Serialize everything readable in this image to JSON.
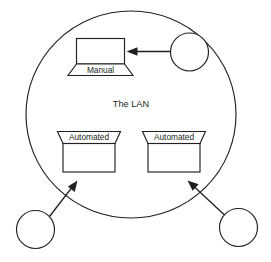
{
  "diagram": {
    "kind": "network-topology-diagram",
    "region": {
      "name": "lan-boundary",
      "label": "The LAN",
      "shape": "ellipse"
    },
    "nodes": [
      {
        "id": "manual-workstation",
        "label": "Manual",
        "shape": "laptop",
        "inside_region": true
      },
      {
        "id": "automated-left",
        "label": "Automated",
        "shape": "hopper-box",
        "inside_region": true
      },
      {
        "id": "automated-right",
        "label": "Automated",
        "shape": "hopper-box",
        "inside_region": true
      },
      {
        "id": "external-actor-top-right",
        "label": "",
        "shape": "circle",
        "inside_region": false
      },
      {
        "id": "external-actor-bottom-left",
        "label": "",
        "shape": "circle",
        "inside_region": false
      },
      {
        "id": "external-actor-bottom-right",
        "label": "",
        "shape": "circle",
        "inside_region": false
      }
    ],
    "connectors": [
      {
        "id": "arrow-to-manual",
        "from": "external-actor-top-right",
        "to": "manual-workstation",
        "direction": "left",
        "style": "solid-arrow"
      },
      {
        "id": "arrow-to-automated-left",
        "from": "external-actor-bottom-left",
        "to": "automated-left",
        "direction": "up-right",
        "style": "solid-arrow"
      },
      {
        "id": "arrow-to-automated-right",
        "from": "external-actor-bottom-right",
        "to": "automated-right",
        "direction": "up-left",
        "style": "solid-arrow"
      }
    ],
    "colors": {
      "stroke": "#231f20",
      "fill": "#ffffff",
      "background": "#ffffff"
    }
  }
}
